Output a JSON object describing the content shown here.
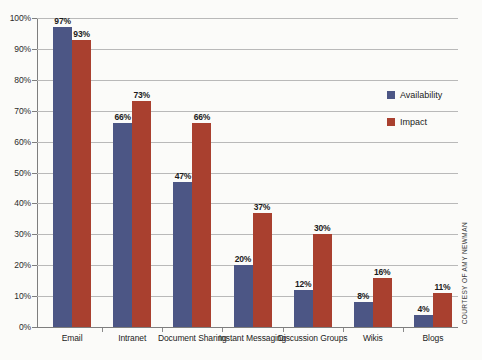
{
  "chart_data": {
    "type": "bar",
    "title": "",
    "subtitle": "",
    "xlabel": "",
    "ylabel": "",
    "ylim": [
      0,
      100
    ],
    "yticks": [
      "0%",
      "10%",
      "20%",
      "30%",
      "40%",
      "50%",
      "60%",
      "70%",
      "80%",
      "90%",
      "100%"
    ],
    "ytick_values": [
      0,
      10,
      20,
      30,
      40,
      50,
      60,
      70,
      80,
      90,
      100
    ],
    "grid": true,
    "legend_position": "right",
    "categories": [
      "Email",
      "Intranet",
      "Document Sharing",
      "Instant Messaging",
      "Discussion Groups",
      "Wikis",
      "Blogs"
    ],
    "series": [
      {
        "name": "Availability",
        "color": "#4c5685",
        "values": [
          97,
          66,
          47,
          20,
          12,
          8,
          4
        ],
        "labels": [
          "97%",
          "66%",
          "47%",
          "20%",
          "12%",
          "8%",
          "4%"
        ]
      },
      {
        "name": "Impact",
        "color": "#a9402f",
        "values": [
          93,
          73,
          66,
          37,
          30,
          16,
          11
        ],
        "labels": [
          "93%",
          "73%",
          "66%",
          "37%",
          "30%",
          "16%",
          "11%"
        ]
      }
    ]
  },
  "legend": {
    "items": [
      {
        "label": "Availability",
        "color": "#4c5685"
      },
      {
        "label": "Impact",
        "color": "#a9402f"
      }
    ]
  },
  "credit": {
    "text": "COURTESY OF AMY NEWMAN"
  },
  "colors": {
    "availability": "#4c5685",
    "impact": "#a9402f",
    "gridline": "#b9b9b9",
    "axis": "#7e7e7e",
    "background": "#fbfbf9",
    "text": "#1c1c1c"
  }
}
